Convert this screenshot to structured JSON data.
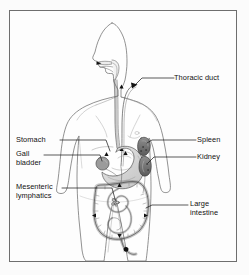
{
  "figure": {
    "kind": "anatomical-diagram",
    "orientation": "anterior body outline with left-facing head profile",
    "frame_border_color": "#6e6e6e",
    "background_color": "#fdfdfd",
    "ink_color": "#111111",
    "organ_fill_color": "#d7d7d7",
    "dark_organ_color": "#6a6a6a"
  },
  "labels": {
    "thoracic_duct": "Thoracic duct",
    "stomach": "Stomach",
    "gall_line1": "Gall",
    "gall_line2": "bladder",
    "mesenteric_line1": "Mesenteric",
    "mesenteric_line2": "lymphatics",
    "spleen": "Spleen",
    "kidney": "Kidney",
    "large_intestine_line1": "Large",
    "large_intestine_line2": "intestine"
  },
  "callouts": [
    {
      "name": "thoracic-duct",
      "side": "right",
      "text": "Thoracic duct",
      "target": "thoracic duct at left subclavian junction"
    },
    {
      "name": "stomach",
      "side": "left",
      "text": "Stomach",
      "target": "stomach body"
    },
    {
      "name": "gall-bladder",
      "side": "left",
      "text": "Gall bladder",
      "target": "gall bladder beneath liver edge"
    },
    {
      "name": "mesenteric-lymphatics",
      "side": "left",
      "text": "Mesenteric lymphatics",
      "target": "mesenteric lymph nodes in small intestine"
    },
    {
      "name": "spleen",
      "side": "right",
      "text": "Spleen",
      "target": "spleen upper left abdomen"
    },
    {
      "name": "kidney",
      "side": "right",
      "text": "Kidney",
      "target": "left kidney"
    },
    {
      "name": "large-intestine",
      "side": "right",
      "text": "Large intestine",
      "target": "descending colon"
    }
  ],
  "structures": [
    "head profile",
    "neck",
    "shoulders",
    "arms",
    "torso outline",
    "legs",
    "mouth and tongue",
    "esophagus",
    "thoracic duct",
    "stomach",
    "gall bladder",
    "spleen",
    "kidney",
    "small intestine",
    "large intestine",
    "cisterna chyli",
    "lymphatic arrow markers"
  ]
}
